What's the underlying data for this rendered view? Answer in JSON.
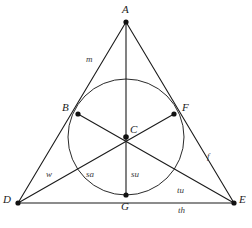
{
  "figure": {
    "type": "euclidean-geometry-diagram",
    "colors": {
      "stroke": "#1b1b1b",
      "circle_stroke": "#2a2a2a",
      "background": "#ffffff",
      "point_fill": "#111111",
      "label_color": "#1b1b1b"
    },
    "geometry": {
      "triangle": {
        "apex": {
          "id": "A",
          "x": 126,
          "y": 22
        },
        "bottom_left": {
          "id": "D",
          "x": 18,
          "y": 203
        },
        "bottom_right": {
          "id": "E",
          "x": 234,
          "y": 203
        }
      },
      "incircle": {
        "center_x": 126,
        "center_y": 137,
        "radius": 58
      },
      "points": [
        {
          "id": "A",
          "x": 126,
          "y": 22,
          "label": "A",
          "label_x": 122,
          "label_y": 4,
          "marker": true
        },
        {
          "id": "B",
          "x": 78,
          "y": 114,
          "label": "B",
          "label_x": 62,
          "label_y": 102,
          "marker": true
        },
        {
          "id": "C",
          "x": 126,
          "y": 137,
          "label": "C",
          "label_x": 130,
          "label_y": 124,
          "marker": true
        },
        {
          "id": "D",
          "x": 18,
          "y": 203,
          "label": "D",
          "label_x": 4,
          "label_y": 196,
          "marker": true
        },
        {
          "id": "E",
          "x": 234,
          "y": 203,
          "label": "E",
          "label_x": 239,
          "label_y": 196,
          "marker": true
        },
        {
          "id": "F",
          "x": 174,
          "y": 114,
          "label": "F",
          "label_x": 182,
          "label_y": 102,
          "marker": true
        },
        {
          "id": "G",
          "x": 126,
          "y": 195,
          "label": "G",
          "label_x": 122,
          "label_y": 200,
          "marker": true
        }
      ],
      "segments": [
        {
          "name": "side-A-D",
          "from": "A",
          "to": "D"
        },
        {
          "name": "side-A-E",
          "from": "A",
          "to": "E"
        },
        {
          "name": "side-D-E",
          "from": "D",
          "to": "E"
        },
        {
          "name": "cevian-A-G",
          "from": "A",
          "to": "G"
        },
        {
          "name": "cevian-D-F",
          "from": "D",
          "to": "F"
        },
        {
          "name": "cevian-E-B",
          "from": "E",
          "to": "B"
        }
      ]
    },
    "labels": {
      "vertices": [
        {
          "name": "vertex-label-A",
          "text": "A",
          "x": 122,
          "y": 4
        },
        {
          "name": "vertex-label-B",
          "text": "B",
          "x": 62,
          "y": 102
        },
        {
          "name": "vertex-label-C",
          "text": "C",
          "x": 130,
          "y": 124
        },
        {
          "name": "vertex-label-D",
          "text": "D",
          "x": 3,
          "y": 194
        },
        {
          "name": "vertex-label-E",
          "text": "E",
          "x": 239,
          "y": 194
        },
        {
          "name": "vertex-label-F",
          "text": "F",
          "x": 182,
          "y": 102
        },
        {
          "name": "vertex-label-G",
          "text": "G",
          "x": 121,
          "y": 201
        }
      ],
      "segments": [
        {
          "name": "segment-label-m",
          "text": "m",
          "x": 86,
          "y": 55
        },
        {
          "name": "segment-label-f",
          "text": "f",
          "x": 207,
          "y": 152
        },
        {
          "name": "segment-label-w",
          "text": "w",
          "x": 46,
          "y": 170
        },
        {
          "name": "segment-label-sa",
          "text": "sa",
          "x": 86,
          "y": 170
        },
        {
          "name": "segment-label-su",
          "text": "su",
          "x": 131,
          "y": 170
        },
        {
          "name": "segment-label-tu",
          "text": "tu",
          "x": 177,
          "y": 186
        },
        {
          "name": "segment-label-th",
          "text": "th",
          "x": 178,
          "y": 206
        }
      ]
    }
  }
}
